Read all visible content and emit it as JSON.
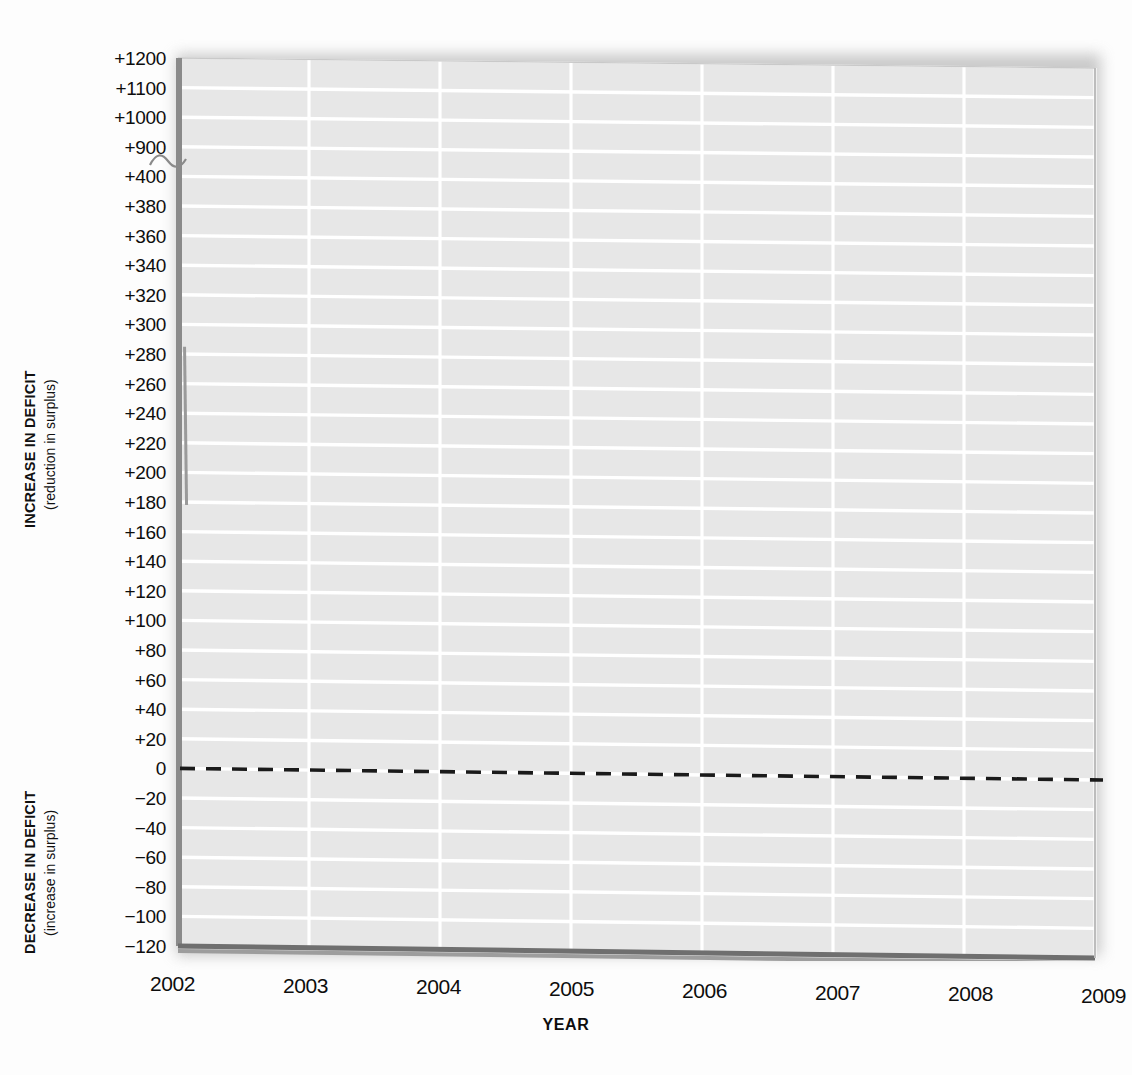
{
  "figure": {
    "cut_off_title": "",
    "background_color": "#fdfdfd",
    "plot_fill": "#e7e7e7",
    "gridline_color": "#ffffff",
    "axis_color": "#8a8a8a",
    "zero_line_color": "#1a1a1a",
    "marker_color": "#9a9a9a"
  },
  "y_axis": {
    "title_main_upper": "INCREASE IN DEFICIT",
    "title_sub_upper": "(reduction in surplus)",
    "title_main_lower": "DECREASE IN DEFICIT",
    "title_sub_lower": "(increase in surplus)",
    "has_axis_break": true,
    "axis_break_between": [
      "+900",
      "+400"
    ],
    "tick_labels": [
      "+1200",
      "+1100",
      "+1000",
      "+900",
      "+400",
      "+380",
      "+360",
      "+340",
      "+320",
      "+300",
      "+280",
      "+260",
      "+240",
      "+220",
      "+200",
      "+180",
      "+160",
      "+140",
      "+120",
      "+100",
      "+80",
      "+60",
      "+40",
      "+20",
      "0",
      "−20",
      "−40",
      "−60",
      "−80",
      "−100",
      "−120"
    ],
    "tick_values": [
      1200,
      1100,
      1000,
      900,
      400,
      380,
      360,
      340,
      320,
      300,
      280,
      260,
      240,
      220,
      200,
      180,
      160,
      140,
      120,
      100,
      80,
      60,
      40,
      20,
      0,
      -20,
      -40,
      -60,
      -80,
      -100,
      -120
    ]
  },
  "x_axis": {
    "title": "YEAR",
    "tick_labels": [
      "2002",
      "2003",
      "2004",
      "2005",
      "2006",
      "2007",
      "2008",
      "2009"
    ],
    "tick_values": [
      2002,
      2003,
      2004,
      2005,
      2006,
      2007,
      2008,
      2009
    ]
  },
  "chart_data": {
    "type": "line",
    "title": "",
    "subtitle": "",
    "xlabel": "YEAR",
    "ylabel": "INCREASE IN DEFICIT (reduction in surplus) / DECREASE IN DEFICIT (increase in surplus)",
    "x": [
      2002,
      2003,
      2004,
      2005,
      2006,
      2007,
      2008,
      2009
    ],
    "xlim": [
      2002,
      2009
    ],
    "ylim": [
      -130,
      1200
    ],
    "y_tick_labels": [
      "+1200",
      "+1100",
      "+1000",
      "+900",
      "+400",
      "+380",
      "+360",
      "+340",
      "+320",
      "+300",
      "+280",
      "+260",
      "+240",
      "+220",
      "+200",
      "+180",
      "+160",
      "+140",
      "+120",
      "+100",
      "+80",
      "+60",
      "+40",
      "+20",
      "0",
      "−20",
      "−40",
      "−60",
      "−80",
      "−100",
      "−120"
    ],
    "y_tick_values": [
      1200,
      1100,
      1000,
      900,
      400,
      380,
      360,
      340,
      320,
      300,
      280,
      260,
      240,
      220,
      200,
      180,
      160,
      140,
      120,
      100,
      80,
      60,
      40,
      20,
      0,
      -20,
      -40,
      -60,
      -80,
      -100,
      -120
    ],
    "grid": true,
    "grid_orientation": "both",
    "legend": false,
    "legend_position": "none",
    "series": [
      {
        "name": "zero reference line",
        "style": "dashed",
        "color": "#1a1a1a",
        "values": [
          0,
          0,
          0,
          0,
          0,
          0,
          0,
          0
        ]
      },
      {
        "name": "2002 range marker",
        "style": "vertical-bar",
        "color": "#9a9a9a",
        "x_position": 2002.05,
        "y_top": 285,
        "y_bottom": 178
      }
    ],
    "annotations": [
      {
        "text": "axis break",
        "between": [
          "+900",
          "+400"
        ],
        "axis": "y"
      }
    ]
  }
}
